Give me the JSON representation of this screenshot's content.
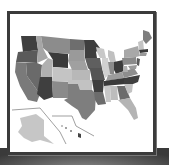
{
  "image": {
    "subject": "United States map thumbnail",
    "style": "grayscale",
    "icon": "us-map-icon"
  },
  "colors": {
    "frame_border": "#3b3b3b",
    "frame_background": "#ffffff",
    "pedestal": "#5e5e5e",
    "state_dark": "#3f3f3f",
    "state_mid_dark": "#5c5c5c",
    "state_mid": "#7c7c7c",
    "state_light": "#a8a8a8",
    "state_lighter": "#c6c6c6",
    "inset_line": "#777777"
  }
}
